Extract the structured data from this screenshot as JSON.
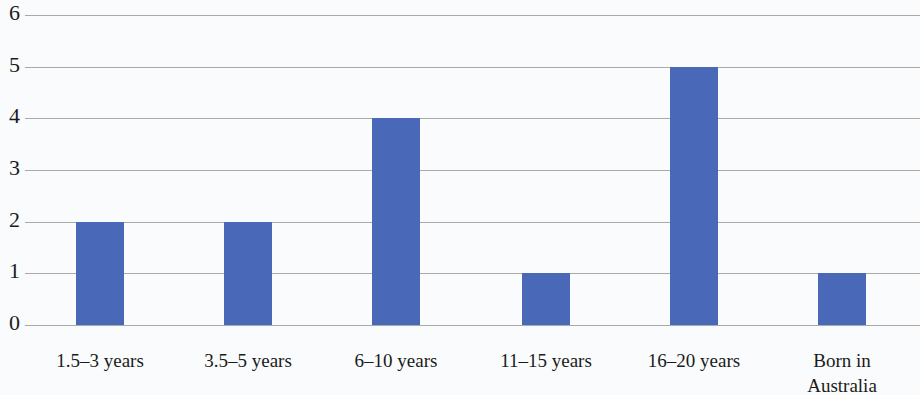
{
  "chart_data": {
    "type": "bar",
    "title": "",
    "subtitle": "",
    "xlabel": "",
    "ylabel": "",
    "categories": [
      "1.5–3 years",
      "3.5–5 years",
      "6–10 years",
      "11–15 years",
      "16–20 years",
      "Born in\nAustralia"
    ],
    "values": [
      2,
      2,
      4,
      1,
      5,
      1
    ],
    "ylim": [
      0,
      6
    ],
    "ytick_labels": [
      "0",
      "1",
      "2",
      "3",
      "4",
      "5",
      "6"
    ],
    "ytick_values": [
      0,
      1,
      2,
      3,
      4,
      5,
      6
    ],
    "grid": true,
    "grid_axis": "y",
    "legend": false,
    "legend_position": "none",
    "annotations": [],
    "colors": {
      "bar": "#4a68b8",
      "gridline": "#9a9a9a",
      "background": "#fafbfc",
      "text": "#1b1b1b"
    },
    "bar_width_px": 48,
    "bar_centers_px": [
      100,
      248,
      396,
      546,
      694,
      842
    ]
  }
}
